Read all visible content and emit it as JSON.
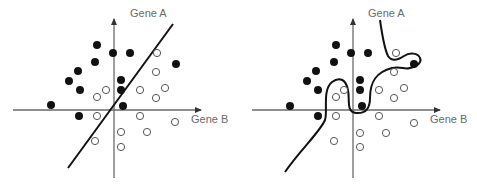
{
  "panels": [
    {
      "id": "linear",
      "y_axis_label": "Gene A",
      "x_axis_label": "Gene B",
      "boundary": "linear",
      "filled_points": [
        [
          97,
          45
        ],
        [
          113,
          53
        ],
        [
          130,
          53
        ],
        [
          95,
          62
        ],
        [
          176,
          64
        ],
        [
          78,
          71
        ],
        [
          69,
          81
        ],
        [
          121,
          80
        ],
        [
          80,
          90
        ],
        [
          121,
          90
        ],
        [
          51,
          105
        ],
        [
          123,
          106
        ],
        [
          79,
          116
        ]
      ],
      "open_points": [
        [
          157,
          53
        ],
        [
          156,
          72
        ],
        [
          106,
          90
        ],
        [
          140,
          90
        ],
        [
          165,
          88
        ],
        [
          97,
          97
        ],
        [
          156,
          98
        ],
        [
          97,
          116
        ],
        [
          140,
          116
        ],
        [
          175,
          122
        ],
        [
          121,
          132
        ],
        [
          147,
          132
        ],
        [
          95,
          141
        ],
        [
          121,
          147
        ]
      ]
    },
    {
      "id": "nonlinear",
      "y_axis_label": "Gene A",
      "x_axis_label": "Gene B",
      "boundary": "nonlinear",
      "filled_points": [
        [
          336,
          45
        ],
        [
          351,
          53
        ],
        [
          368,
          53
        ],
        [
          334,
          62
        ],
        [
          414,
          64
        ],
        [
          316,
          71
        ],
        [
          307,
          81
        ],
        [
          360,
          80
        ],
        [
          318,
          90
        ],
        [
          360,
          90
        ],
        [
          290,
          106
        ],
        [
          362,
          106
        ],
        [
          318,
          116
        ]
      ],
      "open_points": [
        [
          396,
          53
        ],
        [
          394,
          72
        ],
        [
          336,
          97
        ],
        [
          344,
          90
        ],
        [
          379,
          90
        ],
        [
          404,
          88
        ],
        [
          394,
          98
        ],
        [
          336,
          116
        ],
        [
          379,
          116
        ],
        [
          414,
          123
        ],
        [
          360,
          133
        ],
        [
          386,
          133
        ],
        [
          334,
          141
        ],
        [
          360,
          147
        ]
      ]
    }
  ],
  "colors": {
    "axis": "#6a6a6a",
    "boundary": "#111111",
    "filled": "#111111",
    "open_stroke": "#555555"
  }
}
